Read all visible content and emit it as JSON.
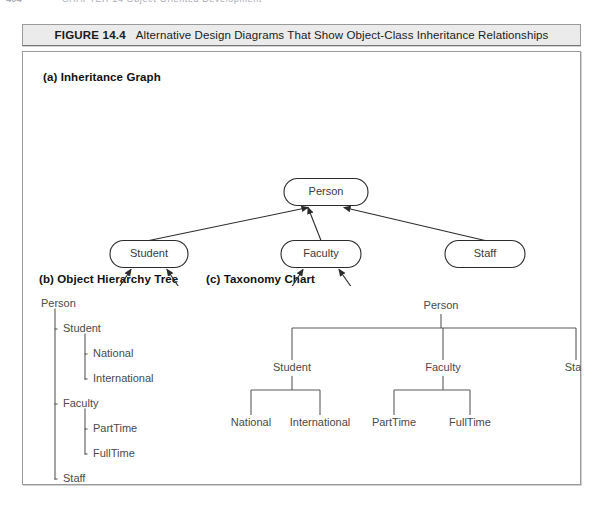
{
  "page": {
    "running_head_number": "404",
    "running_head_title": "CHAPTER 14  Object-Oriented Development"
  },
  "figure": {
    "label": "FIGURE 14.4",
    "caption": "Alternative Design Diagrams That Show Object-Class Inheritance Relationships"
  },
  "panels": {
    "a": {
      "heading": "(a) Inheritance Graph"
    },
    "b": {
      "heading": "(b) Object Hierarchy Tree"
    },
    "c": {
      "heading": "(c) Taxonomy Chart"
    }
  },
  "classes": {
    "root": "Person",
    "student": "Student",
    "faculty": "Faculty",
    "staff": "Staff",
    "national": "National",
    "international": "International",
    "parttime": "PartTime",
    "fulltime": "FullTime"
  },
  "inheritance_graph": {
    "nodes": [
      {
        "id": "person",
        "label": "Person",
        "cx": 303,
        "cy": 106,
        "w": 84,
        "h": 27
      },
      {
        "id": "student",
        "label": "Student",
        "cx": 126,
        "cy": 168,
        "w": 78,
        "h": 27
      },
      {
        "id": "faculty",
        "label": "Faculty",
        "cx": 298,
        "cy": 168,
        "w": 80,
        "h": 27
      },
      {
        "id": "staff",
        "label": "Staff",
        "cx": 462,
        "cy": 168,
        "w": 80,
        "h": 27
      },
      {
        "id": "national",
        "label": "National",
        "cx": 83,
        "cy": 234,
        "w": 76,
        "h": 27
      },
      {
        "id": "international",
        "label": "International",
        "cx": 169,
        "cy": 234,
        "w": 86,
        "h": 27
      },
      {
        "id": "parttime",
        "label": "PartTime",
        "cx": 256,
        "cy": 234,
        "w": 76,
        "h": 27
      },
      {
        "id": "fulltime",
        "label": "FullTime",
        "cx": 342,
        "cy": 234,
        "w": 80,
        "h": 27
      }
    ],
    "edges": [
      {
        "from": "student",
        "to": "person"
      },
      {
        "from": "faculty",
        "to": "person"
      },
      {
        "from": "staff",
        "to": "person"
      },
      {
        "from": "national",
        "to": "student"
      },
      {
        "from": "international",
        "to": "student"
      },
      {
        "from": "parttime",
        "to": "faculty"
      },
      {
        "from": "fulltime",
        "to": "faculty"
      }
    ],
    "arrow_direction": "child-to-parent"
  },
  "object_hierarchy_tree": {
    "rows": [
      {
        "label": "Person",
        "depth": 0
      },
      {
        "label": "Student",
        "depth": 1
      },
      {
        "label": "National",
        "depth": 2
      },
      {
        "label": "International",
        "depth": 2
      },
      {
        "label": "Faculty",
        "depth": 1
      },
      {
        "label": "PartTime",
        "depth": 2
      },
      {
        "label": "FullTime",
        "depth": 2
      },
      {
        "label": "Staff",
        "depth": 1
      }
    ]
  },
  "taxonomy_chart": {
    "levels": [
      {
        "level": 0,
        "labels": [
          "Person"
        ]
      },
      {
        "level": 1,
        "labels": [
          "Student",
          "Faculty",
          "Staff"
        ]
      },
      {
        "level": 2,
        "labels": [
          "National",
          "International",
          "PartTime",
          "FullTime"
        ]
      }
    ],
    "links": [
      {
        "parent": "Person",
        "children": [
          "Student",
          "Faculty",
          "Staff"
        ]
      },
      {
        "parent": "Student",
        "children": [
          "National",
          "International"
        ]
      },
      {
        "parent": "Faculty",
        "children": [
          "PartTime",
          "FullTime"
        ]
      },
      {
        "parent": "Staff",
        "children": []
      }
    ]
  },
  "colors": {
    "page_background": "#ffffff",
    "caption_bar_fill": "#ebebeb",
    "frame_border": "#9a9a9a",
    "node_stroke": "#2c2c2c",
    "node_fill": "#ffffff",
    "label_text": "#3a3a3a",
    "heading_text": "#111111"
  }
}
